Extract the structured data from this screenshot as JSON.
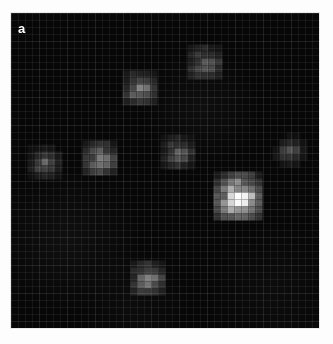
{
  "figure": {
    "panel_label": "a",
    "label_color": "#ffffff",
    "background_color": "#ffffff",
    "panel_background_color": "#070707"
  },
  "chart_data": {
    "type": "heatmap",
    "title": "",
    "subtitle": "",
    "xlabel": "",
    "ylabel": "",
    "grid": true,
    "legend_position": "none",
    "colormap": "grayscale",
    "value_range": [
      0,
      1
    ],
    "axis_units": "pixels",
    "xlim": [
      0,
      308
    ],
    "ylim": [
      0,
      315
    ],
    "annotations": [
      {
        "text": "a",
        "x": 7,
        "y": 9
      }
    ],
    "points": [
      {
        "id": "source-1",
        "x": 129,
        "y": 75,
        "intensity": 0.38,
        "size": 30,
        "label": ""
      },
      {
        "id": "source-2",
        "x": 194,
        "y": 49,
        "intensity": 0.24,
        "size": 34,
        "label": ""
      },
      {
        "id": "source-3",
        "x": 34,
        "y": 149,
        "intensity": 0.26,
        "size": 26,
        "label": ""
      },
      {
        "id": "source-4",
        "x": 89,
        "y": 145,
        "intensity": 0.42,
        "size": 32,
        "label": ""
      },
      {
        "id": "source-5",
        "x": 167,
        "y": 139,
        "intensity": 0.28,
        "size": 28,
        "label": ""
      },
      {
        "id": "source-6",
        "x": 279,
        "y": 137,
        "intensity": 0.2,
        "size": 24,
        "label": ""
      },
      {
        "id": "source-7",
        "x": 227,
        "y": 183,
        "intensity": 1.0,
        "size": 42,
        "label": ""
      },
      {
        "id": "source-8",
        "x": 137,
        "y": 265,
        "intensity": 0.4,
        "size": 30,
        "label": ""
      }
    ],
    "grid_spacing_px": 7,
    "coarse_grid_spacing_px": 28,
    "grid_line_color": "#ffffff",
    "grid_line_opacity": 0.06
  }
}
